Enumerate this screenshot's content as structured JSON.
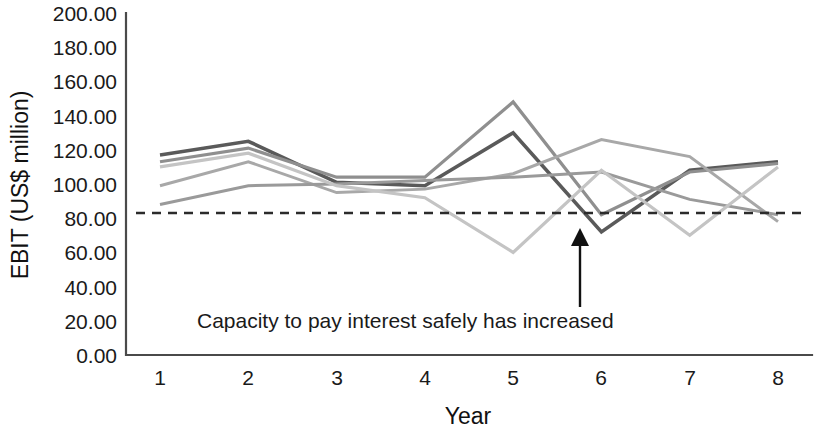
{
  "chart_data": {
    "type": "line",
    "title": "",
    "xlabel": "Year",
    "ylabel": "EBIT (US$ million)",
    "x": [
      1,
      2,
      3,
      4,
      5,
      6,
      7,
      8
    ],
    "categories": [
      "1",
      "2",
      "3",
      "4",
      "5",
      "6",
      "7",
      "8"
    ],
    "xlim": [
      0.6,
      8.4
    ],
    "ylim": [
      0,
      200
    ],
    "y_ticks": [
      "0.00",
      "20.00",
      "40.00",
      "60.00",
      "80.00",
      "100.00",
      "120.00",
      "140.00",
      "160.00",
      "180.00",
      "200.00"
    ],
    "y_tick_values": [
      0,
      20,
      40,
      60,
      80,
      100,
      120,
      140,
      160,
      180,
      200
    ],
    "grid": false,
    "legend": "none",
    "series": [
      {
        "name": "Series A",
        "color": "#5a5a5a",
        "width": 3.6,
        "values": [
          117,
          125,
          101,
          99,
          130,
          72,
          108,
          113
        ]
      },
      {
        "name": "Series B",
        "color": "#8f8f8f",
        "width": 3.2,
        "values": [
          113,
          121,
          104,
          104,
          148,
          82,
          107,
          112
        ]
      },
      {
        "name": "Series C",
        "color": "#a8a8a8",
        "width": 3.0,
        "values": [
          99,
          113,
          95,
          97,
          106,
          126,
          116,
          78
        ]
      },
      {
        "name": "Series D",
        "color": "#9a9a9a",
        "width": 3.0,
        "values": [
          88,
          99,
          100,
          102,
          104,
          107,
          91,
          82
        ]
      },
      {
        "name": "Series E",
        "color": "#c4c4c4",
        "width": 3.2,
        "values": [
          110,
          118,
          99,
          92,
          60,
          108,
          70,
          110
        ]
      }
    ],
    "threshold": {
      "name": "Interest cover threshold",
      "value": 83,
      "style": "dashed",
      "color": "#2b2b2b"
    },
    "annotations": [
      {
        "name": "capacity-note",
        "text": "Capacity to pay interest safely has increased",
        "x_px": 197,
        "y_px": 328,
        "arrow": {
          "from_x_px": 580,
          "from_y_px": 307,
          "to_x_px": 580,
          "to_y_px": 228
        }
      }
    ]
  },
  "axes": {
    "y_axis_title": "EBIT (US$ million)",
    "x_axis_title": "Year"
  }
}
